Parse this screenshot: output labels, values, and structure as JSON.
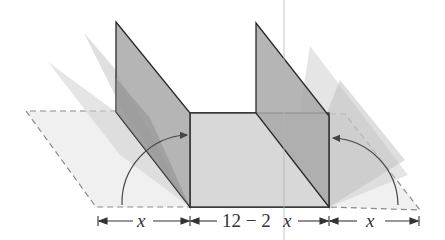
{
  "diagram": {
    "labels": {
      "left_width": "x",
      "middle_width": "12 − 2x",
      "middle_number": "12 − 2",
      "middle_var": "x",
      "right_width": "x"
    },
    "colors": {
      "wall": "#a9a9a9",
      "base": "#d6d6d6",
      "ghost": "#c8c8c8",
      "flat": "#eeeeee",
      "outline": "#2a2a2a",
      "dash": "#8a8a8a"
    }
  }
}
